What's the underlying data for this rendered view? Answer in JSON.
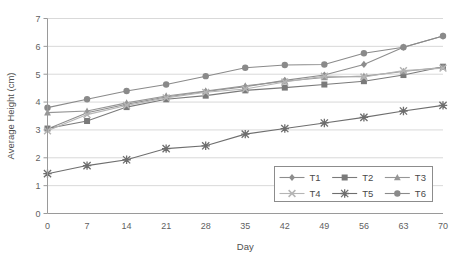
{
  "chart_data": {
    "type": "line",
    "title": "",
    "xlabel": "Day",
    "ylabel": "Average Height (cm)",
    "x": [
      0,
      7,
      14,
      21,
      28,
      35,
      42,
      49,
      56,
      63,
      70
    ],
    "xticklabels": [
      "0",
      "7",
      "14",
      "21",
      "28",
      "35",
      "42",
      "49",
      "56",
      "63",
      "70"
    ],
    "yticklabels": [
      "0",
      "1",
      "2",
      "3",
      "4",
      "5",
      "6",
      "7"
    ],
    "ylim": [
      0,
      7
    ],
    "xlim": [
      0,
      70
    ],
    "grid": "horizontal",
    "legend_position": "inside-bottom-right",
    "series": [
      {
        "name": "T1",
        "marker": "diamond",
        "color": "#8d8d8d",
        "values": [
          3.03,
          3.62,
          3.92,
          4.18,
          4.38,
          4.55,
          4.78,
          4.97,
          5.35,
          5.97,
          6.37
        ]
      },
      {
        "name": "T2",
        "marker": "square",
        "color": "#7a7a7a",
        "values": [
          3.05,
          3.32,
          3.82,
          4.1,
          4.23,
          4.42,
          4.52,
          4.63,
          4.75,
          4.97,
          5.27
        ]
      },
      {
        "name": "T3",
        "marker": "triangle",
        "color": "#969696",
        "values": [
          3.62,
          3.68,
          3.97,
          4.22,
          4.4,
          4.58,
          4.75,
          4.88,
          4.93,
          5.1,
          5.25
        ]
      },
      {
        "name": "T4",
        "marker": "cross",
        "color": "#b5b5b5",
        "values": [
          2.97,
          3.55,
          3.88,
          4.15,
          4.35,
          4.47,
          4.72,
          4.93,
          4.9,
          5.13,
          5.22
        ]
      },
      {
        "name": "T5",
        "marker": "asterisk",
        "color": "#6e6e6e",
        "values": [
          1.43,
          1.72,
          1.93,
          2.33,
          2.43,
          2.85,
          3.05,
          3.25,
          3.45,
          3.68,
          3.88
        ]
      },
      {
        "name": "T6",
        "marker": "circle",
        "color": "#8a8a8a",
        "values": [
          3.8,
          4.1,
          4.4,
          4.63,
          4.93,
          5.23,
          5.33,
          5.35,
          5.75,
          5.97,
          6.37
        ]
      }
    ]
  },
  "legend": {
    "entries": [
      "T1",
      "T2",
      "T3",
      "T4",
      "T5",
      "T6"
    ]
  }
}
